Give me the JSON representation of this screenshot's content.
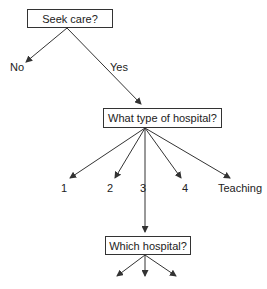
{
  "diagram": {
    "type": "decision-tree",
    "nodes": {
      "seek_care": "Seek care?",
      "hospital_type": "What type of hospital?",
      "which_hospital": "Which hospital?"
    },
    "edge_labels": {
      "no": "No",
      "yes": "Yes"
    },
    "hospital_types": [
      "1",
      "2",
      "3",
      "4",
      "Teaching"
    ],
    "which_hospital_branches": 3,
    "colors": {
      "line": "#333333",
      "text": "#222222",
      "background": "#ffffff"
    }
  }
}
